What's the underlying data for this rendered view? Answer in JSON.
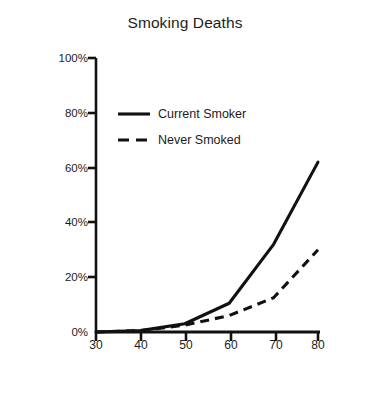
{
  "chart_data": {
    "type": "line",
    "title": "Smoking Deaths",
    "xlabel": "Age",
    "ylabel": "Probability of Death",
    "x": [
      30,
      40,
      50,
      60,
      70,
      80
    ],
    "xtick_labels": [
      "30",
      "40",
      "50",
      "60",
      "70",
      "80"
    ],
    "ytick_values": [
      0,
      20,
      40,
      60,
      80,
      100
    ],
    "ytick_labels": [
      "0%",
      "20%",
      "40%",
      "60%",
      "80%",
      "100%"
    ],
    "xlim": [
      30,
      80
    ],
    "ylim": [
      0,
      100
    ],
    "grid": false,
    "legend_position": "upper-left-inside",
    "series": [
      {
        "name": "Current Smoker",
        "style": "solid",
        "color": "#111111",
        "values": [
          0,
          0.5,
          3,
          10.5,
          32,
          62
        ]
      },
      {
        "name": "Never Smoked",
        "style": "dashed",
        "color": "#111111",
        "values": [
          0,
          0.5,
          2.5,
          6,
          12.5,
          30
        ]
      }
    ]
  },
  "axes": {
    "axis_color": "#111111"
  }
}
